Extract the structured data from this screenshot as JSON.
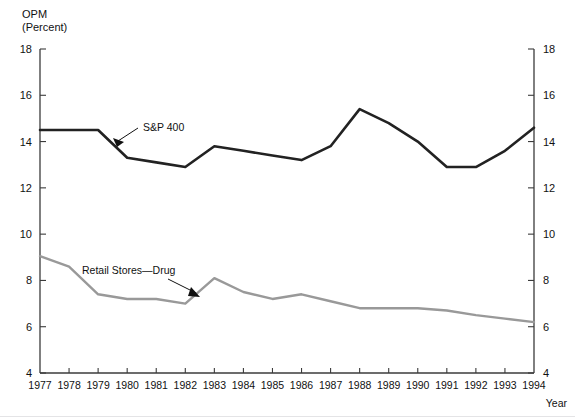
{
  "figure": {
    "clipped_header": "1977-1994",
    "y_axis_title_line1": "OPM",
    "y_axis_title_line2": "(Percent)",
    "x_axis_title": "Year"
  },
  "colors": {
    "sp400_line": "#222222",
    "retail_line": "#999999",
    "axis": "#3b3b3b",
    "text": "#111111"
  },
  "annotations": [
    {
      "name": "sp400-label",
      "text": "S&P 400",
      "x": 143,
      "y": 131
    },
    {
      "name": "retail-label",
      "text": "Retail Stores—Drug",
      "x": 82,
      "y": 274
    }
  ],
  "chart_data": {
    "type": "line",
    "title": "",
    "xlabel": "Year",
    "ylabel": "OPM (Percent)",
    "xlim": [
      1977,
      1994
    ],
    "ylim": [
      4,
      18
    ],
    "ytick_labels": [
      "18",
      "16",
      "14",
      "12",
      "10",
      "8",
      "6",
      "4"
    ],
    "yticks": [
      18,
      16,
      14,
      12,
      10,
      8,
      6,
      4
    ],
    "grid": false,
    "legend_position": "inline-annotations",
    "dual_y_axis": true,
    "x": [
      1977,
      1978,
      1979,
      1980,
      1981,
      1982,
      1983,
      1984,
      1985,
      1986,
      1987,
      1988,
      1989,
      1990,
      1991,
      1992,
      1993,
      1994
    ],
    "xtick_labels": [
      "1977",
      "1978",
      "1979",
      "1980",
      "1981",
      "1982",
      "1983",
      "1984",
      "1985",
      "1986",
      "1987",
      "1988",
      "1989",
      "1990",
      "1991",
      "1992",
      "1993",
      "1994"
    ],
    "series": [
      {
        "name": "S&P 400",
        "color": "#222222",
        "values": [
          14.5,
          14.5,
          14.5,
          13.3,
          13.1,
          12.9,
          13.8,
          13.6,
          13.4,
          13.2,
          13.8,
          15.4,
          14.8,
          14.0,
          12.9,
          12.9,
          13.6,
          14.6
        ]
      },
      {
        "name": "Retail Stores—Drug",
        "color": "#999999",
        "values": [
          9.05,
          8.6,
          7.4,
          7.2,
          7.2,
          7.0,
          8.1,
          7.5,
          7.2,
          7.4,
          7.1,
          6.8,
          6.8,
          6.8,
          6.7,
          6.5,
          6.35,
          6.2
        ]
      }
    ]
  }
}
